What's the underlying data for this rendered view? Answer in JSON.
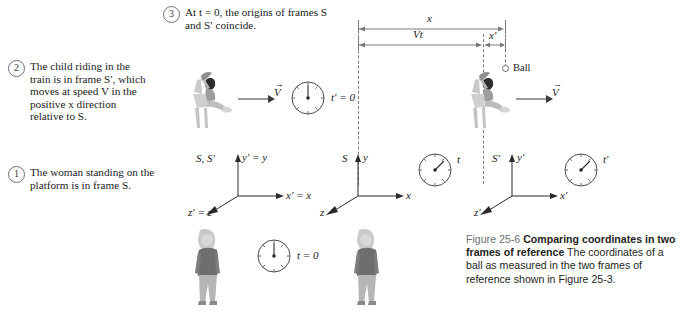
{
  "figure": {
    "id": "25-6",
    "caption_number": "Figure 25-6",
    "caption_title": "Comparing coordinates in two frames of reference",
    "caption_body": "The coordinates of a ball as measured in the two frames of reference shown in Figure 25-3."
  },
  "callouts": [
    {
      "number": "1",
      "text": "The woman standing on the platform is in frame S."
    },
    {
      "number": "2",
      "text": "The child riding in the train is in frame S′, which moves at speed V in the positive x direction relative to S."
    },
    {
      "number": "3",
      "text": "At t = 0, the origins of frames S and S′ coincide."
    }
  ],
  "panels": {
    "top": {
      "name": "initial-state",
      "axes_label_frames": "S, S′",
      "axis_y": "y′ = y",
      "axis_x": "x′ = x",
      "axis_z": "z′ = z",
      "velocity_label": "V",
      "clock_train_label": "t′ = 0",
      "clock_platform_label": "t = 0"
    },
    "bottom": {
      "name": "later-state",
      "left_axes": {
        "frame": "S",
        "axis_y": "y",
        "axis_x": "x",
        "axis_z": "z",
        "clock_label": "t"
      },
      "right_axes": {
        "frame": "S′",
        "axis_y": "y′",
        "axis_x": "x′",
        "axis_z": "z′",
        "clock_label": "t′"
      },
      "velocity_label": "V",
      "ball_label": "Ball",
      "measure_total": "x",
      "measure_frame_offset": "Vt",
      "measure_primed": "x′"
    }
  },
  "colors": {
    "ink": "#1a1a1a",
    "rule": "#7a7a7a",
    "caption_number": "#6d6e71",
    "figure_gray": "#9a9a9a"
  }
}
